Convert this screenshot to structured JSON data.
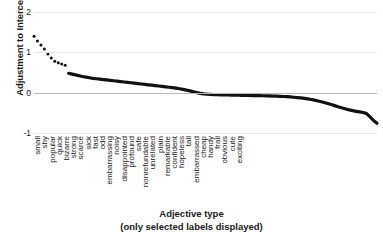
{
  "chart_data": {
    "type": "line",
    "title": "",
    "xlabel": "Adjective type",
    "xlabel_sub": "(only selected labels displayed)",
    "ylabel": "Adjustment to Intercept",
    "ylim": [
      -1,
      2
    ],
    "yticks": [
      2,
      1,
      0,
      -1
    ],
    "ytick_labels": [
      "2",
      "1",
      "0",
      "-1"
    ],
    "grid": "horizontal",
    "grid_color": "#e8e8ec",
    "zero_line_color": "#b9b9bd",
    "line_color": "#111111",
    "legend": "none",
    "xtick_labels": [
      "small",
      "shy",
      "popular",
      "quick",
      "bizarre",
      "strong",
      "scarce",
      "sick",
      "fast",
      "odd",
      "embarrassing",
      "noisy",
      "disappointed",
      "profound",
      "safe",
      "nonrefundable",
      "unrelated",
      "plain",
      "remarkable",
      "confident",
      "hopeless",
      "tall",
      "embarrassed",
      "cheap",
      "handy",
      "frail",
      "obvious",
      "cute",
      "exciting"
    ],
    "xtick_positions": [
      3.2,
      10.4,
      17.6,
      24.8,
      32.0,
      39.2,
      46.4,
      53.6,
      60.8,
      68.0,
      75.2,
      82.4,
      89.6,
      96.8,
      104.0,
      111.2,
      118.4,
      125.6,
      132.8,
      140.0,
      147.2,
      154.4,
      161.6,
      168.8,
      176.0,
      183.2,
      190.4,
      197.6,
      204.8
    ],
    "note": "Values are the modelled adjustment to intercept per adjective, sorted descending.",
    "x": [
      0,
      1,
      2,
      3,
      4,
      5,
      6,
      7,
      8,
      9,
      10,
      11,
      12,
      13,
      14,
      15,
      16,
      17,
      18,
      19,
      20,
      21,
      22,
      23,
      24,
      25,
      26,
      27,
      28,
      29,
      30,
      31,
      32,
      33,
      34,
      35,
      36,
      37,
      38,
      39,
      40,
      41,
      42,
      43,
      44,
      45,
      46,
      47,
      48,
      49,
      50,
      51,
      52,
      53,
      54,
      55,
      56,
      57,
      58,
      59,
      60,
      61,
      62,
      63,
      64,
      65,
      66,
      67,
      68,
      69,
      70,
      71,
      72,
      73,
      74,
      75,
      76,
      77,
      78,
      79,
      80,
      81,
      82,
      83,
      84,
      85,
      86,
      87,
      88,
      89,
      90,
      91,
      92,
      93,
      94,
      95,
      96,
      97,
      98,
      99
    ],
    "values": [
      1.4,
      1.28,
      1.18,
      1.08,
      0.96,
      0.86,
      0.78,
      0.74,
      0.71,
      0.68,
      0.48,
      0.46,
      0.44,
      0.42,
      0.4,
      0.385,
      0.37,
      0.355,
      0.345,
      0.335,
      0.325,
      0.315,
      0.305,
      0.295,
      0.285,
      0.275,
      0.265,
      0.255,
      0.245,
      0.235,
      0.225,
      0.215,
      0.205,
      0.195,
      0.185,
      0.175,
      0.165,
      0.155,
      0.145,
      0.135,
      0.125,
      0.112,
      0.098,
      0.082,
      0.064,
      0.044,
      0.022,
      0.0,
      -0.018,
      -0.03,
      -0.038,
      -0.043,
      -0.047,
      -0.05,
      -0.053,
      -0.055,
      -0.057,
      -0.059,
      -0.061,
      -0.063,
      -0.065,
      -0.067,
      -0.069,
      -0.071,
      -0.073,
      -0.075,
      -0.077,
      -0.079,
      -0.082,
      -0.085,
      -0.088,
      -0.091,
      -0.095,
      -0.1,
      -0.106,
      -0.113,
      -0.121,
      -0.13,
      -0.141,
      -0.154,
      -0.169,
      -0.186,
      -0.205,
      -0.226,
      -0.249,
      -0.274,
      -0.3,
      -0.327,
      -0.354,
      -0.38,
      -0.404,
      -0.426,
      -0.446,
      -0.463,
      -0.478,
      -0.492,
      -0.52,
      -0.6,
      -0.69,
      -0.76
    ],
    "marker_style": "dotted-head",
    "dotted_head_count": 10
  }
}
